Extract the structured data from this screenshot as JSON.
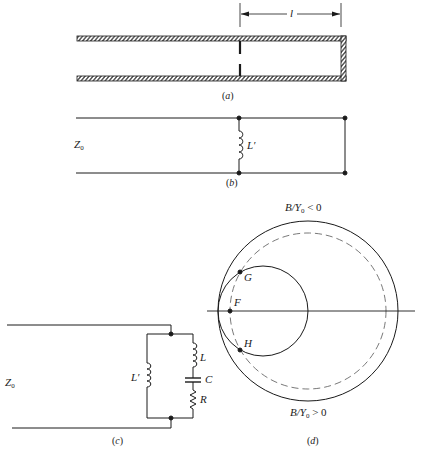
{
  "figure": {
    "panel_a": {
      "caption_open": "(",
      "caption_letter": "a",
      "caption_close": ")",
      "dimension_label": "l",
      "description": "Shorted waveguide section with inductive iris at distance l from short"
    },
    "panel_b": {
      "caption_open": "(",
      "caption_letter": "b",
      "caption_close": ")",
      "line_label": "Z",
      "line_label_sub": "0",
      "shunt_label": "L′"
    },
    "panel_c": {
      "caption_open": "(",
      "caption_letter": "c",
      "caption_close": ")",
      "line_label": "Z",
      "line_label_sub": "0",
      "shunt_label": "L′",
      "series_inductor_label": "L",
      "capacitor_label": "C",
      "resistor_label": "R"
    },
    "panel_d": {
      "caption_open": "(",
      "caption_letter": "d",
      "caption_close": ")",
      "top_label_pre": "B/Y",
      "top_label_sub": "0",
      "top_label_post": " < 0",
      "bottom_label_pre": "B/Y",
      "bottom_label_sub": "0",
      "bottom_label_post": " > 0",
      "point_G": "G",
      "point_F": "F",
      "point_H": "H"
    }
  },
  "colors": {
    "ink": "#1a1a1a",
    "background": "#ffffff"
  }
}
